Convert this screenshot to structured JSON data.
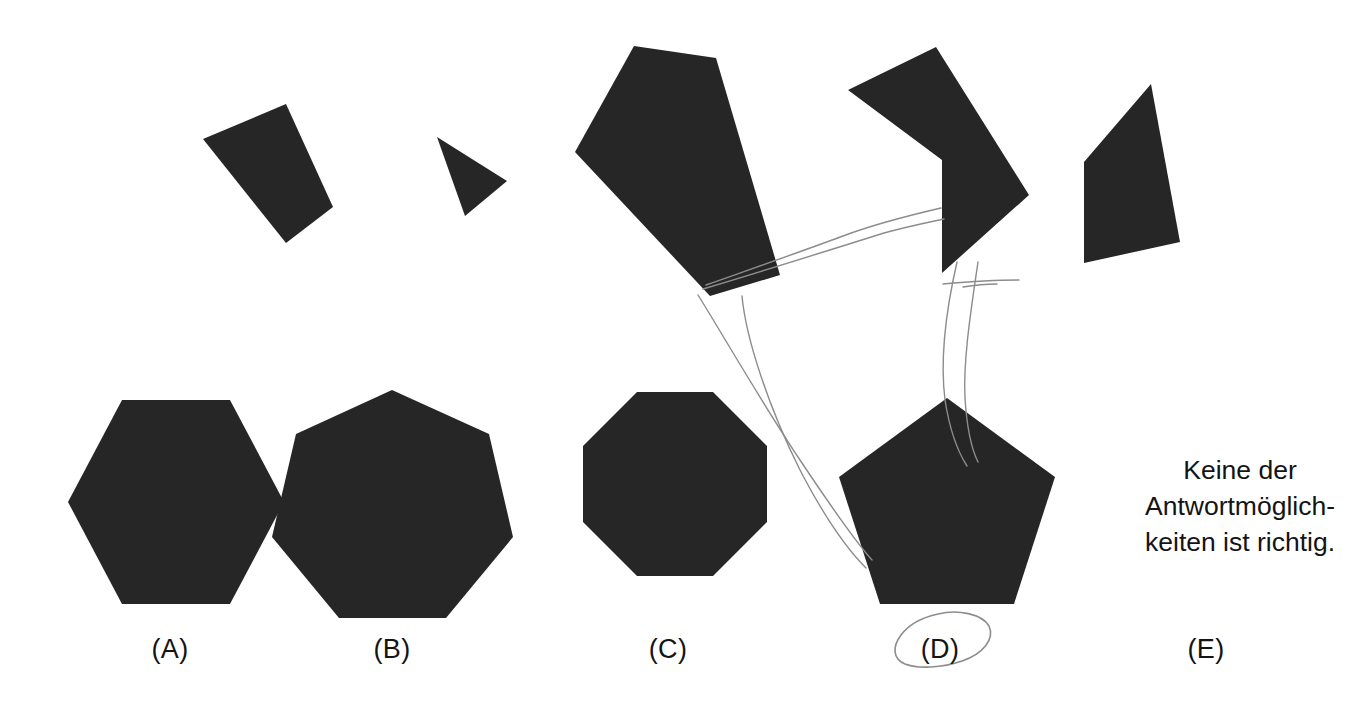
{
  "page": {
    "background_color": "#ffffff",
    "shape_fill_color": "#262626",
    "text_color": "#141414",
    "pencil_color": "#8c8c8c",
    "width": 1367,
    "height": 703
  },
  "answer_text": {
    "full": "Keine der Antwortmöglichkeiten ist richtig.",
    "lines": "Keine der\nAntwortmöglich-\nkeiten ist richtig."
  },
  "options": [
    {
      "id": "A",
      "label": "(A)",
      "shape": "hexagon",
      "sides": 6,
      "x": 170,
      "y": 648
    },
    {
      "id": "B",
      "label": "(B)",
      "shape": "heptagon",
      "sides": 7,
      "x": 392,
      "y": 648
    },
    {
      "id": "C",
      "label": "(C)",
      "shape": "octagon",
      "sides": 8,
      "x": 668,
      "y": 648
    },
    {
      "id": "D",
      "label": "(D)",
      "shape": "pentagon",
      "sides": 5,
      "x": 940,
      "y": 648
    },
    {
      "id": "E",
      "label": "(E)",
      "shape": "none-of-the-above",
      "sides": 0,
      "x": 1206,
      "y": 648
    }
  ],
  "top_shapes": [
    {
      "name": "quadrilateral-tilted",
      "sides": 4,
      "points": "203,139 286,104 333,207 286,243"
    },
    {
      "name": "small-triangle",
      "sides": 3,
      "points": "437,137 507,181 465,216"
    },
    {
      "name": "large-pentagon-dark",
      "sides": 5,
      "points": "634,46 716,58 780,275 710,296 575,152"
    },
    {
      "name": "chevron-arrow",
      "sides": 5,
      "points": "848,90 936,47 1029,195 942,273 942,160"
    },
    {
      "name": "rhombus-right",
      "sides": 4,
      "points": "1151,84 1180,242 1084,263 1084,162"
    }
  ],
  "pencil_marks": [
    {
      "name": "pencil-line-long-diagonal",
      "desc": "line from large pentagon lower-right sweeping down-left to pentagon D area"
    },
    {
      "name": "pencil-line-to-chevron",
      "desc": "line from pentagon edge rising right toward chevron notch"
    },
    {
      "name": "pencil-curve-left",
      "desc": "long vertical curve from chevron down to pentagon D"
    },
    {
      "name": "pencil-curve-right",
      "desc": "second vertical curve parallel to the first"
    },
    {
      "name": "pencil-horizontal-stroke",
      "desc": "short horizontal stroke crossing the two vertical curves"
    },
    {
      "name": "pencil-circle-around-d",
      "desc": "hand-drawn oval circling the (D) answer label"
    }
  ]
}
